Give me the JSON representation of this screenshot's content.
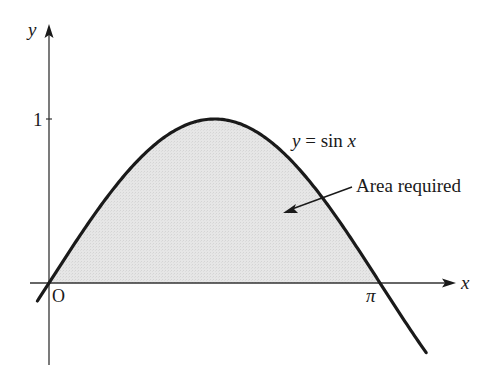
{
  "diagram": {
    "type": "function-graph",
    "function_label_italic_y": "y",
    "function_label_eq": " = sin ",
    "function_label_italic_x": "x",
    "function": "y = sin x",
    "annotation": "Area required",
    "axes": {
      "x_label": "x",
      "y_label": "y",
      "origin_label": "O",
      "x_tick_label": "π",
      "y_tick_label": "1"
    },
    "colors": {
      "curve": "#1a1a1a",
      "axis": "#333333",
      "shading": "#e4e4e4"
    }
  },
  "chart_data": {
    "type": "area",
    "title": "",
    "function": "y = sin x",
    "xlabel": "x",
    "ylabel": "y",
    "x_ticks": [
      "O",
      "π"
    ],
    "y_ticks": [
      "1"
    ],
    "shaded_region": {
      "from": 0,
      "to": 3.14159,
      "label": "Area required"
    },
    "x_range_plotted": [
      -0.11,
      3.58
    ],
    "series": [
      {
        "name": "y = sin x",
        "x": [
          0,
          0.785,
          1.571,
          2.356,
          3.142
        ],
        "values": [
          0,
          0.707,
          1,
          0.707,
          0
        ]
      }
    ]
  }
}
